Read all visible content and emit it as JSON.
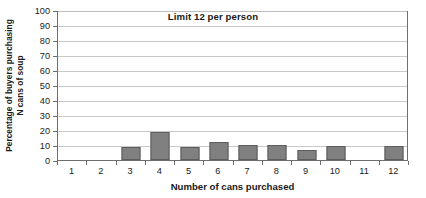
{
  "chart_data": {
    "type": "bar",
    "title": "Limit 12 per person",
    "xlabel": "Number of cans purchased",
    "ylabel_lines": [
      "Percentage of buyers purchasing",
      "N cans of soup"
    ],
    "ylabel": "Percentage of buyers purchasing N cans of soup",
    "categories": [
      "1",
      "2",
      "3",
      "4",
      "5",
      "6",
      "7",
      "8",
      "9",
      "10",
      "11",
      "12"
    ],
    "values": [
      0,
      0,
      8.5,
      19,
      8.5,
      12,
      10,
      10,
      7,
      9.5,
      0,
      9.5
    ],
    "ylim": [
      0,
      100
    ],
    "ytick_values": [
      0,
      10,
      20,
      30,
      40,
      50,
      60,
      70,
      80,
      90,
      100
    ],
    "ytick_labels": [
      "0",
      "10",
      "20",
      "30",
      "40",
      "50",
      "60",
      "70",
      "80",
      "90",
      "100"
    ],
    "grid": true,
    "legend": "none",
    "bar_color": "#808080",
    "bar_edge_color": "#5d5d5d",
    "grid_color": "#c9c9c9",
    "axis_color": "#6e6e6e",
    "text_color": "#1a1a1a",
    "background": "#ffffff"
  }
}
